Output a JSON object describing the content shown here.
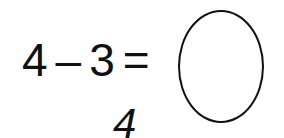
{
  "equation": {
    "operand1": "4",
    "operator": "–",
    "operand2": "3",
    "equals": "=",
    "answer_box": ""
  },
  "below_text": "4"
}
